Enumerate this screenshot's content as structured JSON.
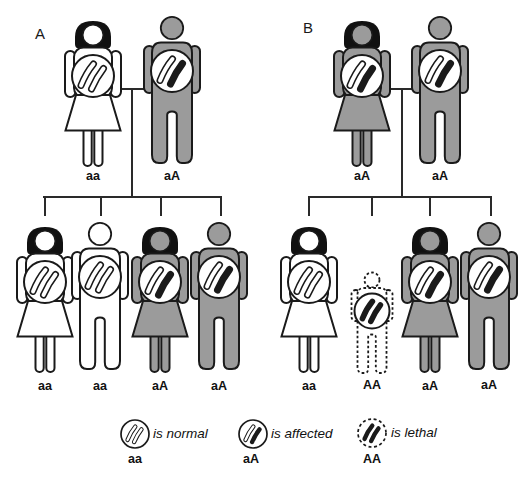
{
  "colors": {
    "background": "#ffffff",
    "figure_gray": "#9b9b9b",
    "ink": "#1a1a1a",
    "hair": "#111111",
    "circle_fill": "#ffffff"
  },
  "panelA": {
    "label": "A",
    "parents": [
      {
        "sex": "female",
        "shade": "white",
        "size": "normal",
        "genotype": "aa",
        "chromosomes": [
          "normal",
          "normal"
        ]
      },
      {
        "sex": "male",
        "shade": "gray",
        "size": "normal",
        "genotype": "aA",
        "chromosomes": [
          "normal",
          "affected"
        ]
      }
    ],
    "children": [
      {
        "sex": "female",
        "shade": "white",
        "size": "normal",
        "genotype": "aa",
        "chromosomes": [
          "normal",
          "normal"
        ]
      },
      {
        "sex": "male",
        "shade": "white",
        "size": "normal",
        "genotype": "aa",
        "chromosomes": [
          "normal",
          "normal"
        ]
      },
      {
        "sex": "female",
        "shade": "gray",
        "size": "normal",
        "genotype": "aA",
        "chromosomes": [
          "normal",
          "affected"
        ]
      },
      {
        "sex": "male",
        "shade": "gray",
        "size": "normal",
        "genotype": "aA",
        "chromosomes": [
          "normal",
          "affected"
        ]
      }
    ]
  },
  "panelB": {
    "label": "B",
    "parents": [
      {
        "sex": "female",
        "shade": "gray",
        "size": "normal",
        "genotype": "aA",
        "chromosomes": [
          "normal",
          "affected"
        ]
      },
      {
        "sex": "male",
        "shade": "gray",
        "size": "normal",
        "genotype": "aA",
        "chromosomes": [
          "normal",
          "affected"
        ]
      }
    ],
    "children": [
      {
        "sex": "female",
        "shade": "white",
        "size": "normal",
        "genotype": "aa",
        "chromosomes": [
          "normal",
          "normal"
        ]
      },
      {
        "sex": "male",
        "shade": "dotted",
        "size": "small",
        "genotype": "AA",
        "chromosomes": [
          "affected",
          "affected"
        ]
      },
      {
        "sex": "female",
        "shade": "gray",
        "size": "normal",
        "genotype": "aA",
        "chromosomes": [
          "normal",
          "affected"
        ]
      },
      {
        "sex": "male",
        "shade": "gray",
        "size": "normal",
        "genotype": "aA",
        "chromosomes": [
          "normal",
          "affected"
        ]
      }
    ]
  },
  "legend": {
    "items": [
      {
        "genotype": "aa",
        "label": "is normal",
        "style": "solid",
        "chromosomes": [
          "normal",
          "normal"
        ]
      },
      {
        "genotype": "aA",
        "label": "is affected",
        "style": "solid",
        "chromosomes": [
          "normal",
          "affected"
        ]
      },
      {
        "genotype": "AA",
        "label": "is lethal",
        "style": "dotted",
        "chromosomes": [
          "affected",
          "affected"
        ]
      }
    ]
  }
}
